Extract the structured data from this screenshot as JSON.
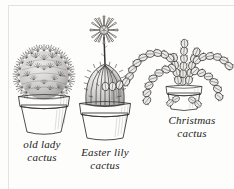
{
  "figure": {
    "kind": "botanical-illustration",
    "medium": "pen-and-ink hatching",
    "background_color": "#fdfdfc",
    "ink_color": "#2f2e2c",
    "rule_color": "#e2e2e0",
    "plants": [
      {
        "id": "old-lady-cactus",
        "label": "old lady\ncactus",
        "label_line_1": "old lady",
        "label_line_2": "cactus",
        "form": "globular, densely covered in fine white radiating spines",
        "pot": "terracotta pot with flared rim",
        "position": "left"
      },
      {
        "id": "easter-lily-cactus",
        "label": "Easter lily\ncactus",
        "label_line_1": "Easter lily",
        "label_line_2": "cactus",
        "form": "ribbed barrel cactus with a tall stalk bearing a many-petalled star-shaped flower",
        "pot": "terracotta pot with flared rim",
        "position": "center"
      },
      {
        "id": "christmas-cactus",
        "label": "Christmas\ncactus",
        "label_line_1": "Christmas",
        "label_line_2": "cactus",
        "form": "arching segmented flattened stems drooping outward from the centre",
        "pot": "small terracotta pot with rim",
        "position": "right"
      }
    ]
  }
}
